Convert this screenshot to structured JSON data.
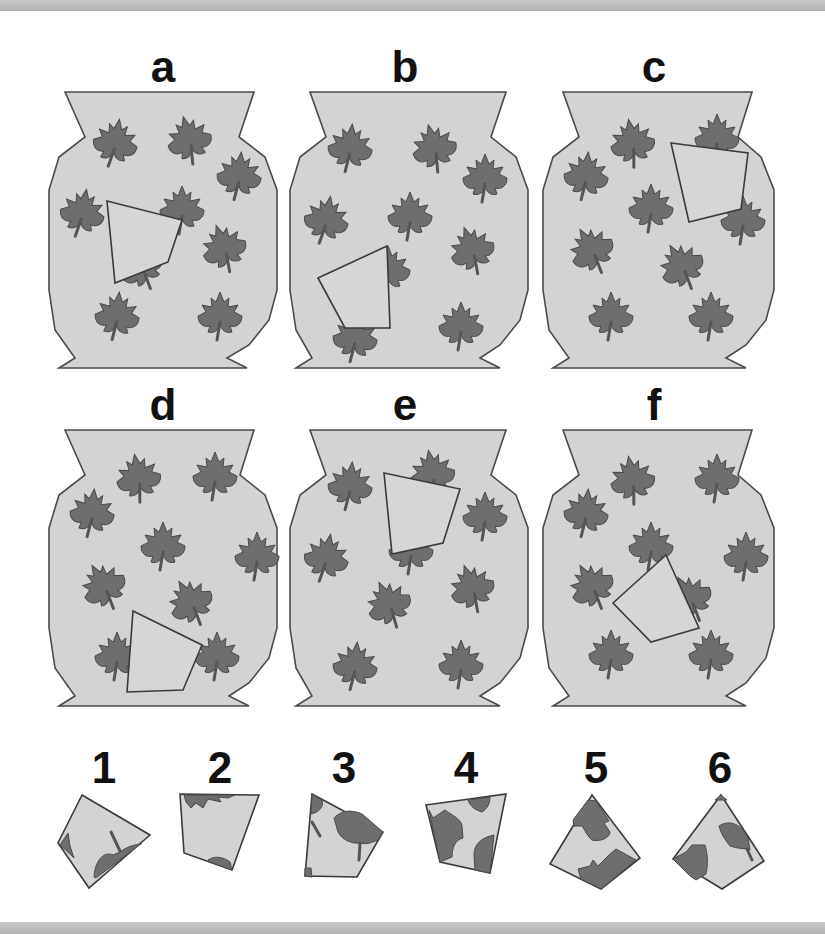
{
  "puzzle": {
    "vases": [
      {
        "label": "a"
      },
      {
        "label": "b"
      },
      {
        "label": "c"
      },
      {
        "label": "d"
      },
      {
        "label": "e"
      },
      {
        "label": "f"
      }
    ],
    "pieces": [
      {
        "label": "1"
      },
      {
        "label": "2"
      },
      {
        "label": "3"
      },
      {
        "label": "4"
      },
      {
        "label": "5"
      },
      {
        "label": "6"
      }
    ]
  },
  "colors": {
    "vase_fill": "#d3d3d3",
    "leaf_fill": "#6e6e6e",
    "outline": "#4a4a4a",
    "background": "#ffffff",
    "band": "#bdbdbd"
  }
}
